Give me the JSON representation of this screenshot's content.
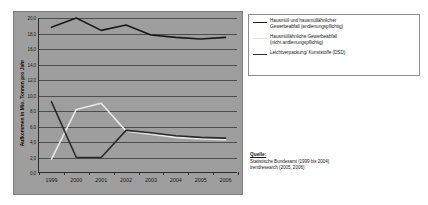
{
  "chart_data": {
    "type": "line",
    "title": "",
    "xlabel": "",
    "ylabel": "Aufkommen in Mio. Tonnen pro Jahr",
    "categories": [
      "1999",
      "2000",
      "2001",
      "2002",
      "2003",
      "2004",
      "2005",
      "2006"
    ],
    "ylim": [
      0.0,
      20.0
    ],
    "yticks": [
      "20,0",
      "18,0",
      "16,0",
      "14,0",
      "12,0",
      "10,0",
      "8,0",
      "6,0",
      "4,0",
      "2,0",
      "0,0"
    ],
    "ytick_values": [
      20.0,
      18.0,
      16.0,
      14.0,
      12.0,
      10.0,
      8.0,
      6.0,
      4.0,
      2.0,
      0.0
    ],
    "grid": true,
    "legend_position": "right",
    "series": [
      {
        "name": "Hausmüll und hausmüllähnlicher Gewerbeabfall (andienungspflichtig)",
        "color": "#1a1a1a",
        "values": [
          18.8,
          20.0,
          18.4,
          19.1,
          17.8,
          17.5,
          17.3,
          17.5
        ]
      },
      {
        "name": "Hausmüllähnliche Gewerbeabfall (nicht andienungspflichtig)",
        "color": "#e8e8e8",
        "values": [
          1.8,
          8.2,
          9.0,
          5.4,
          5.0,
          4.6,
          4.4,
          4.3
        ]
      },
      {
        "name": "Leichtverpackung/ Kunststoffe (DSD)",
        "color": "#2b2b2b",
        "values": [
          9.2,
          2.0,
          2.0,
          5.5,
          5.2,
          4.8,
          4.6,
          4.5
        ]
      }
    ]
  },
  "legend": {
    "items": [
      {
        "label_line1": "Hausmüll und hausmüllähnlicher",
        "label_line2": "Gewerbeabfall (andienungspflichtig)",
        "color": "#1a1a1a"
      },
      {
        "label_line1": "Hausmüllähnliche Gewerbeabfall",
        "label_line2": "(nicht andienungspflichtig)",
        "color": "#e0e0e0"
      },
      {
        "label_line1": "Leichtverpackung/ Kunststoffe (DSD)",
        "label_line2": "",
        "color": "#2b2b2b"
      }
    ]
  },
  "source": {
    "title": "Quelle:",
    "line1": "Statistische Bundesamt (1999 bis 2004)",
    "line2": "trendresearch (2005, 2006)"
  }
}
